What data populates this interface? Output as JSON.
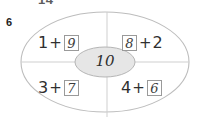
{
  "page": {
    "top_fragment_text": "14",
    "exercise_number": "6"
  },
  "diagram": {
    "type": "part-whole-ellipse",
    "center_value": "10",
    "quadrants": [
      {
        "position": "top-left",
        "first_term": "1",
        "operator": "+",
        "second_term": "9",
        "boxed_term": "second",
        "filled_answer": "9"
      },
      {
        "position": "top-right",
        "first_term": "8",
        "operator": "+",
        "second_term": "2",
        "boxed_term": "first",
        "filled_answer": "8"
      },
      {
        "position": "bottom-left",
        "first_term": "3",
        "operator": "+",
        "second_term": "7",
        "boxed_term": "second",
        "filled_answer": "7"
      },
      {
        "position": "bottom-right",
        "first_term": "4",
        "operator": "+",
        "second_term": "6",
        "boxed_term": "second",
        "filled_answer": "6"
      }
    ]
  },
  "colors": {
    "outline": "#bdbdbd",
    "divider": "#cfcfcf",
    "center_fill": "#e6e6e6",
    "box_border": "#9a9a9a",
    "ink": "#2f2f2f"
  }
}
